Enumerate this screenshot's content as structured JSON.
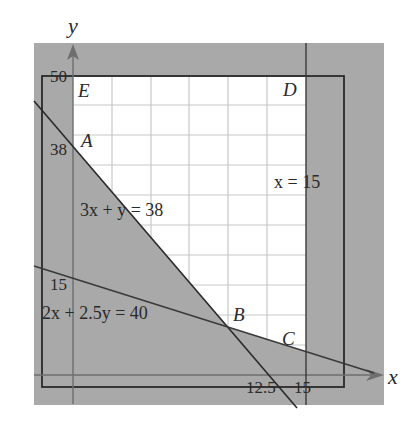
{
  "diagram": {
    "type": "linear-programming-feasible-region",
    "axes": {
      "x_label": "x",
      "y_label": "y"
    },
    "tick_labels": {
      "y_50": "50",
      "y_38": "38",
      "y_15": "15",
      "x_12_5": "12.5",
      "x_15": "15"
    },
    "lines": {
      "line1": "3x + y = 38",
      "line2": "2x + 2.5y = 40",
      "line3": "x = 15"
    },
    "vertices": {
      "A": "A",
      "B": "B",
      "C": "C",
      "D": "D",
      "E": "E"
    },
    "colors": {
      "shade": "#a9a9a9",
      "feasible": "#ffffff",
      "grid": "#c8c8c8",
      "ink": "#2a2a2a",
      "axis": "#6e6e6e"
    }
  }
}
